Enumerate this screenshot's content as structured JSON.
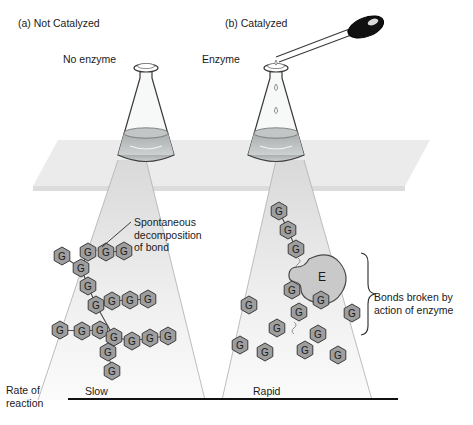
{
  "figure": {
    "panels": [
      {
        "id": "a",
        "title": "(a) Not Catalyzed",
        "flask_label": "No enzyme",
        "rate_label": "Slow"
      },
      {
        "id": "b",
        "title": "(b) Catalyzed",
        "flask_label": "Enzyme",
        "rate_label": "Rapid"
      }
    ],
    "annotations": {
      "spontaneous": "Spontaneous\ndecomposition\nof bond",
      "bonds_broken": "Bonds broken by\naction of enzyme",
      "rate_axis": "Rate of\nreaction"
    },
    "molecule_letter": "G",
    "enzyme_letter": "E",
    "colors": {
      "outline": "#3a3a3a",
      "liquid": "#b8bcbc",
      "shelf": "#e8e8e8",
      "cone": "#efefef",
      "hexagon_fill": "#9e9e9e",
      "enzyme_fill": "#c8c8c8",
      "bulb": "#111111",
      "text": "#1a1a1a"
    },
    "molecules_left": [
      {
        "x": 62,
        "y": 256
      },
      {
        "x": 81,
        "y": 268
      },
      {
        "x": 88,
        "y": 252
      },
      {
        "x": 106,
        "y": 252
      },
      {
        "x": 124,
        "y": 251
      },
      {
        "x": 88,
        "y": 286
      },
      {
        "x": 96,
        "y": 305
      },
      {
        "x": 112,
        "y": 301
      },
      {
        "x": 130,
        "y": 300
      },
      {
        "x": 148,
        "y": 299
      },
      {
        "x": 60,
        "y": 330
      },
      {
        "x": 82,
        "y": 331
      },
      {
        "x": 100,
        "y": 330
      },
      {
        "x": 114,
        "y": 337
      },
      {
        "x": 132,
        "y": 341
      },
      {
        "x": 150,
        "y": 338
      },
      {
        "x": 168,
        "y": 336
      },
      {
        "x": 108,
        "y": 352
      },
      {
        "x": 112,
        "y": 371
      }
    ],
    "molecules_right": [
      {
        "x": 279,
        "y": 211
      },
      {
        "x": 288,
        "y": 230
      },
      {
        "x": 296,
        "y": 249
      },
      {
        "x": 292,
        "y": 290
      },
      {
        "x": 249,
        "y": 305
      },
      {
        "x": 299,
        "y": 312
      },
      {
        "x": 277,
        "y": 328
      },
      {
        "x": 318,
        "y": 334
      },
      {
        "x": 240,
        "y": 345
      },
      {
        "x": 265,
        "y": 352
      },
      {
        "x": 305,
        "y": 350
      },
      {
        "x": 338,
        "y": 355
      },
      {
        "x": 352,
        "y": 313
      },
      {
        "x": 321,
        "y": 300
      }
    ]
  }
}
